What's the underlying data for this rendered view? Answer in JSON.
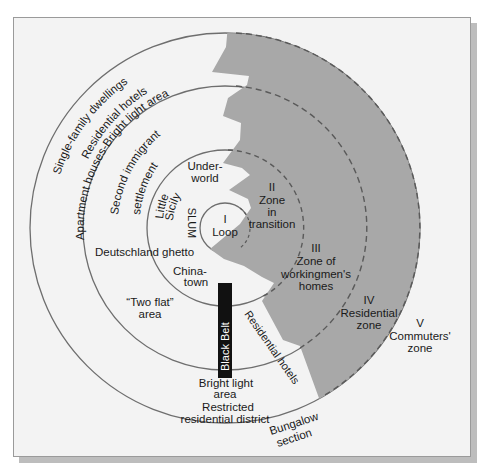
{
  "diagram": {
    "colors": {
      "background": "#f3f3f3",
      "shaded_sector": "#a8a8a8",
      "ring_line": "#6e6e6e",
      "black_belt": "#111111",
      "frame_border": "#9a9a9a",
      "shadow": "#bdbdbd"
    },
    "zones": [
      {
        "id": "I",
        "numeral": "I",
        "name": "Loop"
      },
      {
        "id": "II",
        "numeral": "II",
        "name_line1": "Zone",
        "name_line2": "in",
        "name_line3": "transition"
      },
      {
        "id": "III",
        "numeral": "III",
        "name_line1": "Zone of",
        "name_line2": "workingmen's",
        "name_line3": "homes"
      },
      {
        "id": "IV",
        "numeral": "IV",
        "name_line1": "Residential",
        "name_line2": "zone"
      },
      {
        "id": "V",
        "numeral": "V",
        "name_line1": "Commuters'",
        "name_line2": "zone"
      }
    ],
    "area_labels": {
      "single_family": "Single-family dwellings",
      "residential_hotels_outer": "Residential hotels",
      "apartment_houses": "Apartment houses-Bright light area",
      "second_immigrant": "Second immigrant",
      "settlement": "settlement",
      "underworld_1": "Under-",
      "underworld_2": "world",
      "little_sicily_1": "Little",
      "little_sicily_2": "Sicily",
      "slum": "SLUM",
      "deutschland": "Deutschland ghetto",
      "chinatown_1": "China-",
      "chinatown_2": "town",
      "two_flat_1": "“Two flat”",
      "two_flat_2": "area",
      "black_belt": "Black Belt",
      "residential_hotels_inner": "Residential hotels",
      "bright_light_1": "Bright light",
      "bright_light_2": "area",
      "restricted_1": "Restricted",
      "restricted_2": "residential district",
      "bungalow_1": "Bungalow",
      "bungalow_2": "section"
    }
  }
}
